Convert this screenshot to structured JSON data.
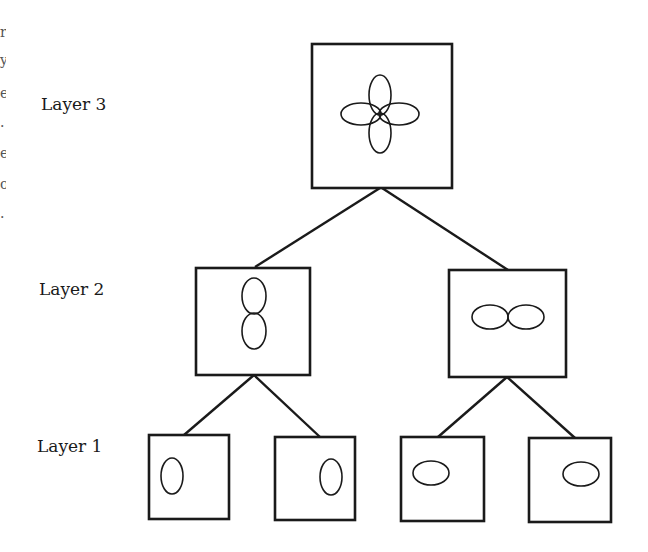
{
  "diagram": {
    "type": "hierarchy",
    "layers": [
      {
        "label": "Layer 3",
        "nodes": [
          {
            "id": "n3",
            "glyph": "four-petal-ellipses"
          }
        ]
      },
      {
        "label": "Layer 2",
        "nodes": [
          {
            "id": "n2a",
            "glyph": "vertical-ellipse-pair"
          },
          {
            "id": "n2b",
            "glyph": "horizontal-ellipse-pair"
          }
        ]
      },
      {
        "label": "Layer 1",
        "nodes": [
          {
            "id": "n1a",
            "glyph": "vertical-ellipse-left"
          },
          {
            "id": "n1b",
            "glyph": "vertical-ellipse-right"
          },
          {
            "id": "n1c",
            "glyph": "horizontal-ellipse-left"
          },
          {
            "id": "n1d",
            "glyph": "horizontal-ellipse-right"
          }
        ]
      }
    ],
    "edges": [
      [
        "n3",
        "n2a"
      ],
      [
        "n3",
        "n2b"
      ],
      [
        "n2a",
        "n1a"
      ],
      [
        "n2a",
        "n1b"
      ],
      [
        "n2b",
        "n1c"
      ],
      [
        "n2b",
        "n1d"
      ]
    ],
    "labels": {
      "layer3": "Layer 3",
      "layer2": "Layer 2",
      "layer1": "Layer 1"
    },
    "edge_fragments": [
      "r",
      "y",
      "e",
      ".",
      "e",
      "o",
      "."
    ],
    "colors": {
      "stroke": "#1a1a1a",
      "background": "#ffffff"
    }
  }
}
